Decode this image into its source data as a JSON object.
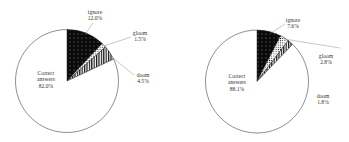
{
  "chart_data": [
    {
      "type": "pie",
      "title": "",
      "start_angle": "12 o'clock",
      "direction": "clockwise",
      "categories": [
        "ignore",
        "gloom",
        "doom",
        "Correct answers"
      ],
      "values": [
        12.0,
        1.5,
        4.5,
        82.0
      ],
      "labels": [
        {
          "name": "ignore",
          "value": "12.0%"
        },
        {
          "name": "gloom",
          "value": "1.5%"
        },
        {
          "name": "doom",
          "value": "4.5%"
        },
        {
          "name": "Correct answers",
          "value": "82.0%"
        }
      ],
      "fills": [
        "black-dotted",
        "white-dotted",
        "vertical-stripes",
        "white"
      ],
      "legend": "none (direct labels with leader lines)"
    },
    {
      "type": "pie",
      "title": "",
      "start_angle": "12 o'clock",
      "direction": "clockwise",
      "categories": [
        "ignore",
        "gloom",
        "doom",
        "Correct answers"
      ],
      "values": [
        7.6,
        2.8,
        1.8,
        88.1
      ],
      "labels": [
        {
          "name": "ignore",
          "value": "7.6%"
        },
        {
          "name": "gloom",
          "value": "2.8%"
        },
        {
          "name": "doom",
          "value": "1.8%"
        },
        {
          "name": "Correct answers",
          "value": "88.1%"
        }
      ],
      "fills": [
        "black-dotted",
        "white-dotted",
        "vertical-stripes",
        "white"
      ],
      "legend": "none (direct labels with leader lines)"
    }
  ],
  "pies": [
    {
      "ignore": {
        "name": "ignore",
        "pct": "12.0%"
      },
      "gloom": {
        "name": "gloom",
        "pct": "1.5%"
      },
      "doom": {
        "name": "doom",
        "pct": "4.5%"
      },
      "correct": {
        "name1": "Correct",
        "name2": "answers",
        "pct": "82.0%"
      }
    },
    {
      "ignore": {
        "name": "ignore",
        "pct": "7.6%"
      },
      "gloom": {
        "name": "gloom",
        "pct": "2.8%"
      },
      "doom": {
        "name": "doom",
        "pct": "1.8%"
      },
      "correct": {
        "name1": "Correct",
        "name2": "answers",
        "pct": "88.1%"
      }
    }
  ]
}
